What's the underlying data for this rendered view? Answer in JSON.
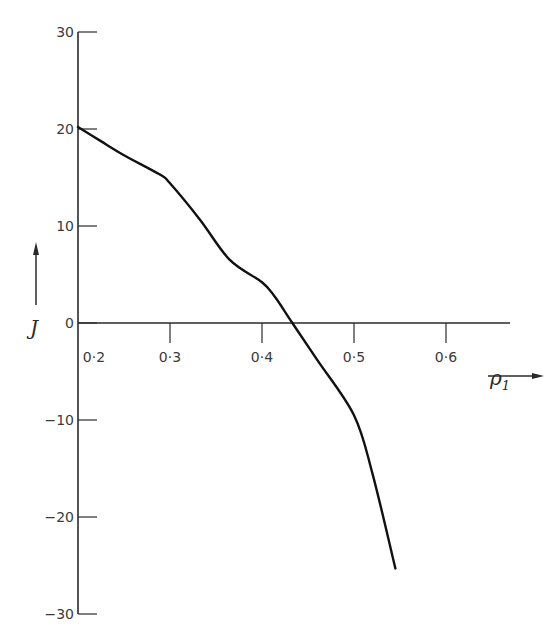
{
  "chart_data": {
    "type": "line",
    "title": "",
    "xlabel": "ρ₁",
    "ylabel": "J",
    "xlim": [
      0.2,
      0.66
    ],
    "ylim": [
      -30,
      30
    ],
    "x_ticks": [
      0.2,
      0.3,
      0.4,
      0.5,
      0.6
    ],
    "x_tick_labels": [
      "0·2",
      "0·3",
      "0·4",
      "0·5",
      "0·6"
    ],
    "y_ticks": [
      30,
      20,
      10,
      0,
      -10,
      -20,
      -30
    ],
    "y_tick_labels": [
      "30",
      "20",
      "10",
      "0",
      "-10",
      "-20",
      "-30"
    ],
    "grid": false,
    "legend": null,
    "series": [
      {
        "name": "J vs ρ1",
        "x": [
          0.2,
          0.224,
          0.25,
          0.289,
          0.3,
          0.333,
          0.365,
          0.4,
          0.414,
          0.433,
          0.46,
          0.5,
          0.52,
          0.545
        ],
        "y": [
          20.2,
          18.8,
          17.3,
          15.3,
          14.4,
          10.6,
          6.5,
          4.2,
          2.7,
          0,
          -3.8,
          -9.5,
          -15.5,
          -25.3
        ]
      }
    ],
    "annotations": [
      "arrow up beside J label",
      "arrow right below ρ1 label"
    ]
  },
  "labels": {
    "y_axis_symbol": "J",
    "x_axis_symbol": "ρ",
    "x_axis_subscript": "1"
  }
}
